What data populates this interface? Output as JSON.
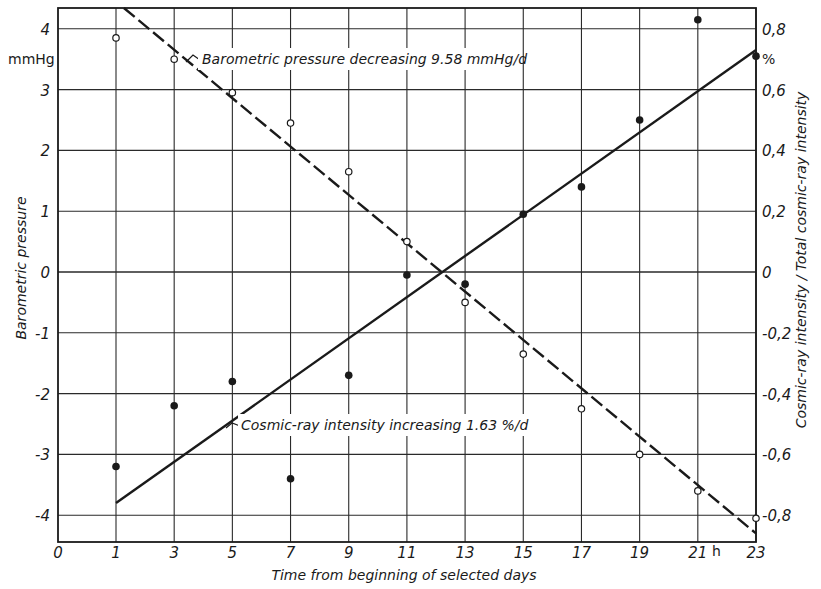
{
  "chart_data": {
    "type": "scatter",
    "title": "",
    "xlabel": "Time from beginning of selected days",
    "x_unit": "h",
    "ylabel_left": "Barometric pressure",
    "y_unit_left": "mmHg",
    "ylabel_right": "Cosmic-ray intensity / Total cosmic-ray intensity",
    "y_unit_right": "%",
    "xlim": [
      0,
      23
    ],
    "ylim_left": [
      -4.3,
      4.35
    ],
    "ylim_right": [
      -0.86,
      0.87
    ],
    "grid": true,
    "x_ticks": [
      0,
      1,
      3,
      5,
      7,
      9,
      11,
      13,
      15,
      17,
      19,
      21,
      23
    ],
    "y_ticks_left": [
      4,
      3,
      2,
      1,
      0,
      -1,
      -2,
      -3,
      -4
    ],
    "y_ticks_right": [
      0.8,
      0.6,
      0.4,
      0.2,
      0,
      -0.2,
      -0.4,
      -0.6,
      -0.8
    ],
    "x": [
      1,
      3,
      5,
      7,
      9,
      11,
      13,
      15,
      17,
      19,
      21,
      23
    ],
    "series": [
      {
        "name": "Barometric pressure",
        "axis": "left",
        "marker": "open-circle",
        "values": [
          3.85,
          3.5,
          2.95,
          2.45,
          1.65,
          0.5,
          -0.5,
          -1.35,
          -2.25,
          -3.0,
          -3.6,
          -4.05
        ]
      },
      {
        "name": "Cosmic-ray intensity",
        "axis": "right",
        "marker": "filled-circle",
        "values": [
          -0.64,
          -0.44,
          -0.36,
          -0.68,
          -0.34,
          -0.01,
          -0.04,
          0.19,
          0.28,
          0.5,
          0.83,
          0.71
        ]
      }
    ],
    "fit_lines": [
      {
        "name": "Barometric pressure decreasing 9.58 mmHg/d",
        "axis": "left",
        "style": "dashed",
        "slope_label": "9.58 mmHg/d",
        "from": {
          "x": 1,
          "y": 4.45
        },
        "to": {
          "x": 23,
          "y": -4.3
        }
      },
      {
        "name": "Cosmic-ray intensity increasing 1.63 %/d",
        "axis": "right",
        "style": "solid",
        "slope_label": "1.63 %/d",
        "from": {
          "x": 1,
          "y": -0.76
        },
        "to": {
          "x": 23,
          "y": 0.73
        }
      }
    ],
    "annotations": [
      "Barometric pressure decreasing 9.58 mmHg/d",
      "Cosmic-ray intensity increasing 1.63 %/d"
    ]
  },
  "labels": {
    "x_title": "Time from beginning of selected days",
    "x_unit": "h",
    "y_left_title": "Barometric pressure",
    "y_left_unit": "mmHg",
    "y_right_title": "Cosmic-ray intensity / Total cosmic-ray intensity",
    "y_right_unit": "%",
    "annot_pressure": "Barometric pressure decreasing 9.58 mmHg/d",
    "annot_cosmic": "Cosmic-ray intensity increasing 1.63 %/d"
  },
  "colors": {
    "ink": "#1a1a1a",
    "grid": "#2a2a2a",
    "background": "#ffffff"
  }
}
